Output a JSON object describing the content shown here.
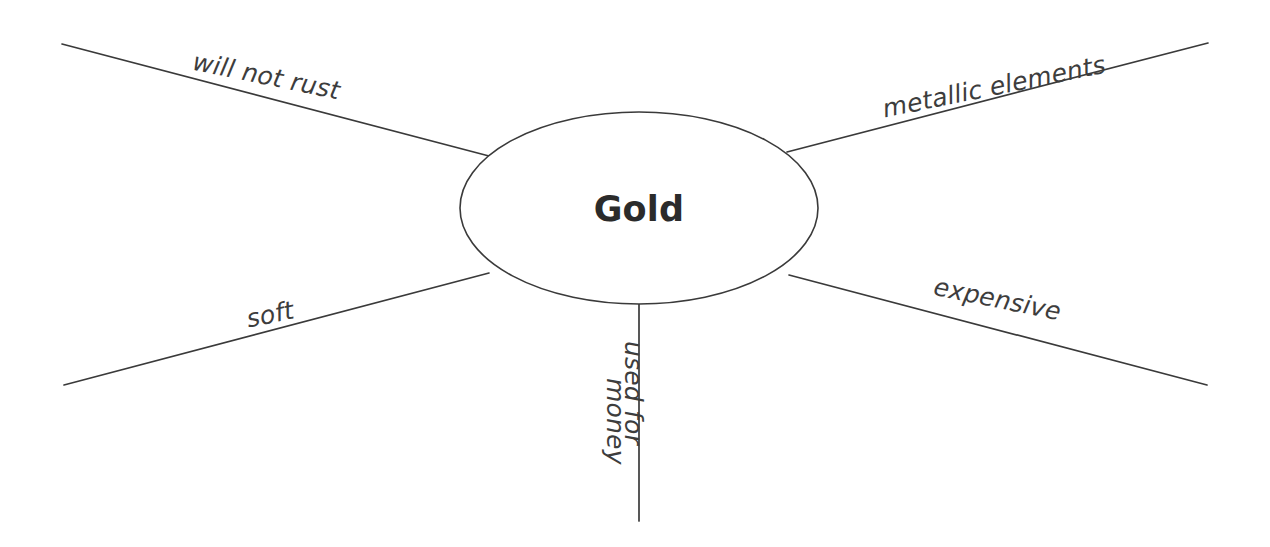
{
  "diagram": {
    "type": "concept-map",
    "title": "Gold",
    "center": {
      "label": "Gold",
      "shape": "ellipse"
    },
    "branches": [
      {
        "id": "will-not-rust",
        "label": "will not rust",
        "position": "top-left"
      },
      {
        "id": "metallic-elements",
        "label": "metallic elements",
        "position": "top-right"
      },
      {
        "id": "soft",
        "label": "soft",
        "position": "bottom-left"
      },
      {
        "id": "expensive",
        "label": "expensive",
        "position": "bottom-right"
      },
      {
        "id": "used-for",
        "label": "used for",
        "position": "bottom-center-right"
      },
      {
        "id": "money",
        "label": "money",
        "position": "bottom-center-left"
      }
    ],
    "colors": {
      "stroke": "#3a3a3a",
      "center_text": "#2b2b2b",
      "branch_text": "#3d3d3d",
      "background": "#ffffff"
    }
  }
}
